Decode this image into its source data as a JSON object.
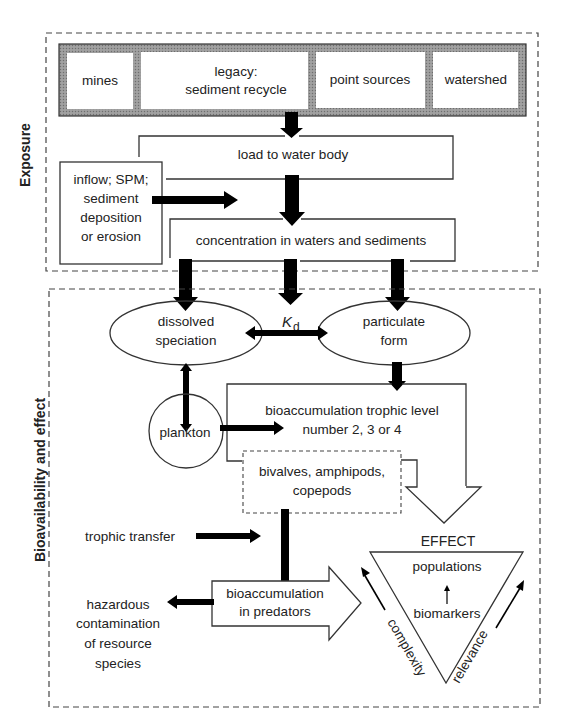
{
  "sections": {
    "exposure": {
      "label": "Exposure"
    },
    "bioavailability": {
      "label": "Bioavailability and effect"
    }
  },
  "sources": {
    "items": [
      {
        "label": "mines"
      },
      {
        "label_line1": "legacy:",
        "label_line2": "sediment recycle"
      },
      {
        "label": "point sources"
      },
      {
        "label": "watershed"
      }
    ],
    "frame_color": "#8a8a8a"
  },
  "nodes": {
    "load": {
      "label": "load to water body"
    },
    "inflow": {
      "lines": [
        "inflow; SPM;",
        "sediment",
        "deposition",
        "or erosion"
      ]
    },
    "concentration": {
      "label": "concentration in waters and sediments"
    },
    "dissolved": {
      "line1": "dissolved",
      "line2": "speciation"
    },
    "kd": {
      "symbol": "K",
      "subscript": "d"
    },
    "particulate": {
      "line1": "particulate",
      "line2": "form"
    },
    "plankton": {
      "label": "plankton"
    },
    "bioaccum_trophic": {
      "line1": "bioaccumulation trophic level",
      "line2": "number 2, 3 or 4"
    },
    "invertebrates": {
      "line1": "bivalves, amphipods,",
      "line2": "copepods"
    },
    "trophic_transfer": {
      "label": "trophic transfer"
    },
    "bioaccum_predators": {
      "line1": "bioaccumulation",
      "line2": "in predators"
    },
    "hazardous": {
      "lines": [
        "hazardous",
        "contamination",
        "of resource",
        "species"
      ]
    }
  },
  "effect": {
    "title": "EFFECT",
    "top": "populations",
    "bottom": "biomarkers",
    "left_axis": "complexity",
    "right_axis": "relevance"
  }
}
